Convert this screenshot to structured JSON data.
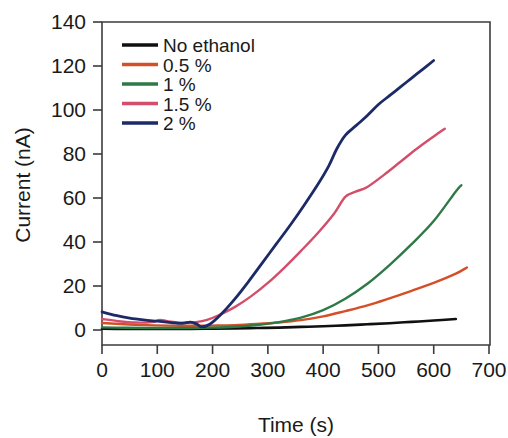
{
  "chart_data": {
    "type": "line",
    "title": "",
    "xlabel": "Time (s)",
    "ylabel": "Current (nA)",
    "xlim": [
      0,
      700
    ],
    "ylim": [
      -18,
      140
    ],
    "xticks": [
      0,
      100,
      200,
      300,
      400,
      500,
      600,
      700
    ],
    "yticks": [
      0,
      20,
      40,
      60,
      80,
      100,
      120,
      140
    ],
    "xtick_labels": [
      "0",
      "100",
      "200",
      "300",
      "400",
      "500",
      "600",
      "700"
    ],
    "ytick_labels": [
      "0",
      "20",
      "40",
      "60",
      "80",
      "100",
      "120",
      "140"
    ],
    "grid": false,
    "legend_position": "upper-left-inside",
    "series": [
      {
        "name": "No ethanol",
        "color": "#101010",
        "points": [
          [
            0,
            0.6
          ],
          [
            40,
            0.5
          ],
          [
            80,
            0.5
          ],
          [
            120,
            0.5
          ],
          [
            160,
            0.5
          ],
          [
            200,
            0.6
          ],
          [
            240,
            0.7
          ],
          [
            280,
            0.9
          ],
          [
            320,
            1.1
          ],
          [
            360,
            1.4
          ],
          [
            400,
            1.7
          ],
          [
            440,
            2.1
          ],
          [
            480,
            2.6
          ],
          [
            520,
            3.1
          ],
          [
            560,
            3.7
          ],
          [
            600,
            4.3
          ],
          [
            640,
            5.0
          ]
        ]
      },
      {
        "name": "0.5 %",
        "color": "#d44f28",
        "points": [
          [
            0,
            3.2
          ],
          [
            40,
            2.6
          ],
          [
            80,
            2.2
          ],
          [
            120,
            2.0
          ],
          [
            160,
            1.9
          ],
          [
            200,
            2.0
          ],
          [
            240,
            2.2
          ],
          [
            280,
            2.7
          ],
          [
            320,
            3.4
          ],
          [
            360,
            4.5
          ],
          [
            400,
            6.2
          ],
          [
            440,
            8.6
          ],
          [
            480,
            11.2
          ],
          [
            520,
            14.4
          ],
          [
            560,
            17.8
          ],
          [
            600,
            21.4
          ],
          [
            640,
            25.6
          ],
          [
            660,
            28.4
          ]
        ]
      },
      {
        "name": "1 %",
        "color": "#2d7a46",
        "points": [
          [
            0,
            1.2
          ],
          [
            40,
            1.0
          ],
          [
            80,
            0.9
          ],
          [
            120,
            0.9
          ],
          [
            160,
            0.9
          ],
          [
            200,
            1.1
          ],
          [
            240,
            1.5
          ],
          [
            280,
            2.3
          ],
          [
            320,
            3.6
          ],
          [
            360,
            5.6
          ],
          [
            400,
            9.0
          ],
          [
            440,
            14.2
          ],
          [
            480,
            21.0
          ],
          [
            520,
            29.5
          ],
          [
            560,
            39.0
          ],
          [
            600,
            49.5
          ],
          [
            640,
            63.0
          ],
          [
            650,
            65.8
          ]
        ]
      },
      {
        "name": "1.5 %",
        "color": "#d34e6a",
        "points": [
          [
            0,
            5.0
          ],
          [
            30,
            4.0
          ],
          [
            60,
            3.4
          ],
          [
            90,
            3.6
          ],
          [
            105,
            4.6
          ],
          [
            120,
            3.9
          ],
          [
            150,
            3.3
          ],
          [
            170,
            3.6
          ],
          [
            190,
            4.6
          ],
          [
            210,
            6.6
          ],
          [
            240,
            10.4
          ],
          [
            270,
            15.4
          ],
          [
            300,
            21.4
          ],
          [
            330,
            28.4
          ],
          [
            360,
            36.0
          ],
          [
            390,
            44.0
          ],
          [
            420,
            53.0
          ],
          [
            440,
            60.5
          ],
          [
            460,
            63.0
          ],
          [
            480,
            65.0
          ],
          [
            510,
            70.5
          ],
          [
            540,
            76.5
          ],
          [
            570,
            82.5
          ],
          [
            600,
            88.0
          ],
          [
            620,
            91.5
          ]
        ]
      },
      {
        "name": "2 %",
        "color": "#1d2a68",
        "points": [
          [
            0,
            8.2
          ],
          [
            25,
            6.6
          ],
          [
            50,
            5.4
          ],
          [
            75,
            4.6
          ],
          [
            100,
            4.0
          ],
          [
            125,
            3.4
          ],
          [
            145,
            3.0
          ],
          [
            160,
            3.6
          ],
          [
            172,
            2.6
          ],
          [
            180,
            1.4
          ],
          [
            195,
            2.6
          ],
          [
            215,
            7.0
          ],
          [
            240,
            14.0
          ],
          [
            265,
            22.0
          ],
          [
            290,
            30.5
          ],
          [
            315,
            39.0
          ],
          [
            340,
            47.5
          ],
          [
            365,
            56.5
          ],
          [
            390,
            66.0
          ],
          [
            410,
            74.5
          ],
          [
            425,
            82.5
          ],
          [
            440,
            88.5
          ],
          [
            460,
            93.0
          ],
          [
            480,
            97.5
          ],
          [
            500,
            102.5
          ],
          [
            520,
            106.5
          ],
          [
            540,
            110.5
          ],
          [
            560,
            114.5
          ],
          [
            580,
            118.5
          ],
          [
            600,
            122.5
          ]
        ]
      }
    ]
  },
  "legend": {
    "entries": [
      {
        "label": "No ethanol",
        "color": "#101010"
      },
      {
        "label": "0.5 %",
        "color": "#d44f28"
      },
      {
        "label": "1 %",
        "color": "#2d7a46"
      },
      {
        "label": "1.5 %",
        "color": "#d34e6a"
      },
      {
        "label": "2 %",
        "color": "#1d2a68"
      }
    ]
  }
}
